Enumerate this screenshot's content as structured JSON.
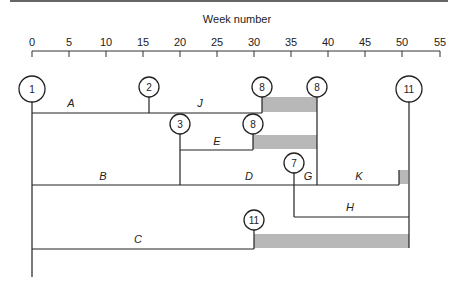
{
  "axis": {
    "title": "Week number",
    "ticks": [
      "0",
      "5",
      "10",
      "15",
      "20",
      "25",
      "30",
      "35",
      "40",
      "45",
      "50",
      "55"
    ]
  },
  "nodes": [
    {
      "id": "1",
      "week": 0
    },
    {
      "id": "2",
      "week": 16
    },
    {
      "id": "8",
      "week": 31.5
    },
    {
      "id": "8",
      "week": 39
    },
    {
      "id": "11",
      "week": 51.5
    },
    {
      "id": "3",
      "week": 20
    },
    {
      "id": "8",
      "week": 30
    },
    {
      "id": "7",
      "week": 35.5
    },
    {
      "id": "11",
      "week": 30
    }
  ],
  "activities": {
    "A": "A",
    "J": "J",
    "E": "E",
    "B": "B",
    "D": "D",
    "G": "G",
    "K": "K",
    "H": "H",
    "C": "C"
  },
  "float_color": "#b8b8b8",
  "line_color": "#222222"
}
